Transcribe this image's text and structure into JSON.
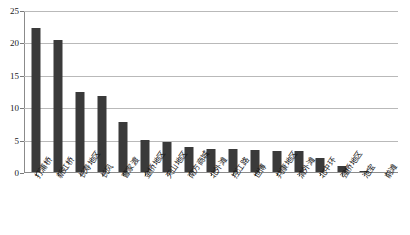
{
  "chart_data": {
    "type": "bar",
    "title": "",
    "xlabel": "",
    "ylabel": "",
    "ylim": [
      0,
      25
    ],
    "yticks": [
      0,
      5,
      10,
      15,
      20,
      25
    ],
    "grid": true,
    "legend": "none",
    "orientation": "vertical",
    "bar_color": "#3a3a3a",
    "categories": [
      "打浦桥",
      "新虹桥",
      "长寿地区",
      "长风",
      "曹家渡",
      "金桥地区",
      "天山地区",
      "南方商城",
      "北外滩",
      "控江路",
      "世博",
      "共康地区",
      "清外滩",
      "北中环",
      "强桥地区",
      "池宝",
      "前滩"
    ],
    "values": [
      22.2,
      20.3,
      12.3,
      11.8,
      7.7,
      5.0,
      4.6,
      3.9,
      3.6,
      3.5,
      3.4,
      3.3,
      3.2,
      2.2,
      1.0,
      0.2,
      0.0
    ]
  },
  "axis": {
    "y_tick_labels": [
      "0",
      "5",
      "10",
      "15",
      "20",
      "25"
    ]
  }
}
